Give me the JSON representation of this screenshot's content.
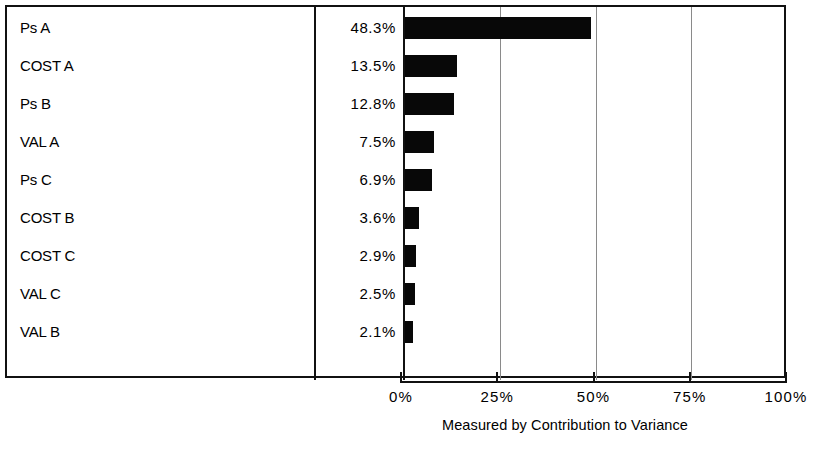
{
  "chart_data": {
    "type": "bar",
    "orientation": "horizontal",
    "title": "",
    "subtitle": "",
    "caption": "Measured by Contribution to Variance",
    "xlabel": "",
    "ylabel": "",
    "xlim": [
      0,
      100
    ],
    "grid": true,
    "legend": "none",
    "x_tick_labels": [
      "0%",
      "25%",
      "50%",
      "75%",
      "100%"
    ],
    "x_ticks": [
      0,
      25,
      50,
      75,
      100
    ],
    "categories": [
      "Ps A",
      "COST A",
      "Ps B",
      "VAL A",
      "Ps C",
      "COST B",
      "COST C",
      "VAL C",
      "VAL B"
    ],
    "values": [
      48.3,
      13.5,
      12.8,
      7.5,
      6.9,
      3.6,
      2.9,
      2.5,
      2.1
    ],
    "value_labels": [
      "48.3%",
      "13.5%",
      "12.8%",
      "7.5%",
      "6.9%",
      "3.6%",
      "2.9%",
      "2.5%",
      "2.1%"
    ],
    "rows": [
      {
        "label": "Ps A",
        "value": 48.3,
        "value_label": "48.3%"
      },
      {
        "label": "COST A",
        "value": 13.5,
        "value_label": "13.5%"
      },
      {
        "label": "Ps B",
        "value": 12.8,
        "value_label": "12.8%"
      },
      {
        "label": "VAL A",
        "value": 7.5,
        "value_label": "7.5%"
      },
      {
        "label": "Ps C",
        "value": 6.9,
        "value_label": "6.9%"
      },
      {
        "label": "COST B",
        "value": 3.6,
        "value_label": "3.6%"
      },
      {
        "label": "COST C",
        "value": 2.9,
        "value_label": "2.9%"
      },
      {
        "label": "VAL C",
        "value": 2.5,
        "value_label": "2.5%"
      },
      {
        "label": "VAL B",
        "value": 2.1,
        "value_label": "2.1%"
      }
    ],
    "colors": {
      "bar": "#080808",
      "frame": "#111111",
      "gridline": "#8a8a8a",
      "background": "#ffffff",
      "text": "#000000"
    }
  }
}
